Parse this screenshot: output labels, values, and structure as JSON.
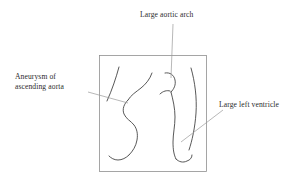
{
  "figure": {
    "type": "medical-line-diagram",
    "background_color": "#ffffff",
    "ink_color": "#3a3a3a",
    "frame_color": "#8c8c8c",
    "leader_color": "#9a9a9a",
    "frame": {
      "x": 99,
      "y": 55,
      "width": 108,
      "height": 117
    }
  },
  "labels": {
    "aortic_arch": {
      "text": "Large aortic arch",
      "leader_from": [
        173,
        24
      ],
      "leader_to": [
        171,
        78
      ]
    },
    "aneurysm": {
      "line1": "Aneurysm of",
      "line2": "ascending aorta",
      "leader_from": [
        88,
        92
      ],
      "leader_to": [
        128,
        103
      ]
    },
    "left_ventricle": {
      "text": "Large left ventricle",
      "leader_from": [
        223,
        110
      ],
      "leader_to": [
        181,
        142
      ]
    }
  }
}
